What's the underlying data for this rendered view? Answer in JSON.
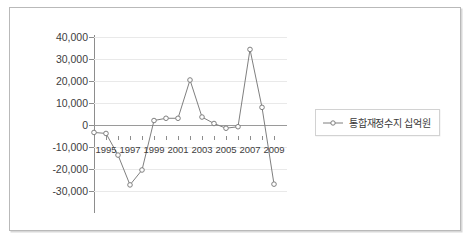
{
  "chart_data": {
    "type": "line",
    "title": "",
    "xlabel": "",
    "ylabel": "",
    "grid": true,
    "legend_position": "right",
    "ylim": [
      -30000,
      40000
    ],
    "ytick_values": [
      40000,
      30000,
      20000,
      10000,
      0,
      -10000,
      -20000,
      -30000
    ],
    "ytick_labels": [
      "40,000",
      "30,000",
      "20,000",
      "10,000",
      "0",
      "-10,000",
      "-20,000",
      "-30,000"
    ],
    "xlim": [
      1994,
      2009
    ],
    "x": [
      1994,
      1995,
      1996,
      1997,
      1998,
      1999,
      2000,
      2001,
      2002,
      2003,
      2004,
      2005,
      2006,
      2007,
      2008,
      2009
    ],
    "xtick_labels": [
      "1995",
      "1997",
      "1999",
      "2001",
      "2003",
      "2005",
      "2007",
      "2009"
    ],
    "xtick_values": [
      1995,
      1997,
      1999,
      2001,
      2003,
      2005,
      2007,
      2009
    ],
    "series": [
      {
        "name": "통합재정수지 십억원",
        "marker": "circle",
        "color": "#7f7f7f",
        "values": [
          1600,
          1200,
          -7500,
          -19500,
          -13500,
          6400,
          7300,
          7300,
          22700,
          7800,
          5200,
          3300,
          3900,
          35000,
          11700,
          -19200
        ]
      }
    ]
  },
  "legend": {
    "entries": [
      {
        "label": "통합재정수지 십억원",
        "marker_icon": "line-circle-marker-icon"
      }
    ]
  }
}
